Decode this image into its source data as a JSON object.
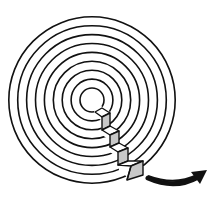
{
  "diagram": {
    "type": "concentric-rings-with-staircase",
    "rings": {
      "count": 9,
      "center": [
        92,
        100
      ],
      "inner_radius": 12,
      "spacing": 8.9,
      "stroke": "#111111"
    },
    "staircase": {
      "steps": 4,
      "riser_fill": "#c8c8c8",
      "tread_fill": "#ffffff",
      "direction": "descending outward toward lower-right"
    },
    "arrow": {
      "icon": "curved-arrow-right-icon",
      "color": "#111111",
      "direction": "clockwise / rightward"
    },
    "colors": {
      "background": "#ffffff",
      "line": "#111111",
      "shade": "#c8c8c8"
    }
  }
}
